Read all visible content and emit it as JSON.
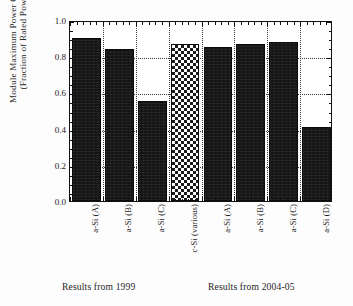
{
  "chart_data": {
    "type": "bar",
    "title": "",
    "xlabel": "",
    "ylabel": "Module Maximum Power Output (Fraction of Rated Power)",
    "ylabel_line1": "Module Maximum Power Output",
    "ylabel_line2": "(Fraction of Rated Power)",
    "ylim": [
      0.0,
      1.0
    ],
    "ytick_labels": [
      "1.0",
      "0.8",
      "0.6",
      "0.4",
      "0.2",
      "0.0"
    ],
    "ytick_values": [
      1.0,
      0.8,
      0.6,
      0.4,
      0.2,
      0.0
    ],
    "gridlines": [
      0.2,
      0.4,
      0.6,
      0.8
    ],
    "grid": "dotted-horizontal-and-vertical",
    "legend": "none",
    "categories": [
      "a-Si (A)",
      "a-Si (B)",
      "a-Si (C)",
      "c-Si (various)",
      "a-Si (A)",
      "a-Si (B)",
      "a-Si (C)",
      "a-Si (D)"
    ],
    "values": [
      0.9,
      0.84,
      0.55,
      0.87,
      0.85,
      0.87,
      0.88,
      0.41
    ],
    "bar_fills": [
      "solid",
      "solid",
      "solid",
      "checker",
      "solid",
      "solid",
      "solid",
      "solid"
    ],
    "groups": [
      {
        "caption": "Results from 1999",
        "bar_indices": [
          0,
          1,
          2,
          3
        ]
      },
      {
        "caption": "Results from 2004-05",
        "bar_indices": [
          4,
          5,
          6,
          7
        ]
      }
    ],
    "group_captions": [
      "Results from 1999",
      "Results from 2004-05"
    ],
    "colors": {
      "bar_solid": "#141414",
      "bar_checker_dark": "#1b1b1b",
      "bar_checker_light": "#ffffff",
      "axis": "#111111",
      "grid": "#3a3a3a",
      "background": "#ffffff",
      "text": "#1a1a1a"
    }
  }
}
